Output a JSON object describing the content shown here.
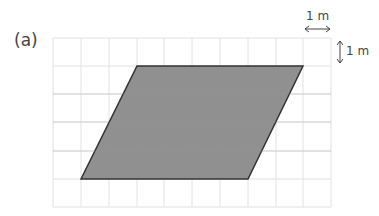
{
  "figure": {
    "part_label": "(a)",
    "scale_horizontal": "1 m",
    "scale_vertical": "1 m",
    "grid": {
      "columns": 10,
      "rows": 6,
      "cell_unit": "1 m"
    },
    "shape": {
      "type": "parallelogram",
      "fill": "#8a8a8a",
      "stroke": "#333333",
      "vertices_grid": [
        [
          3,
          1
        ],
        [
          9,
          1
        ],
        [
          7,
          5
        ],
        [
          1,
          5
        ]
      ],
      "base_m": 6,
      "height_m": 4
    }
  }
}
